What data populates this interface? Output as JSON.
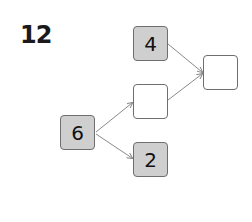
{
  "problem": {
    "number": "12"
  },
  "nodes": [
    {
      "id": "top",
      "label": "4",
      "filled": true,
      "x": 133,
      "y": 26
    },
    {
      "id": "left",
      "label": "6",
      "filled": true,
      "x": 60,
      "y": 115
    },
    {
      "id": "middle",
      "label": "",
      "filled": false,
      "x": 133,
      "y": 84
    },
    {
      "id": "bottom",
      "label": "2",
      "filled": true,
      "x": 133,
      "y": 142
    },
    {
      "id": "right",
      "label": "",
      "filled": false,
      "x": 203,
      "y": 55
    }
  ],
  "edges": [
    {
      "from": "left",
      "to": "middle"
    },
    {
      "from": "left",
      "to": "bottom"
    },
    {
      "from": "top",
      "to": "right"
    },
    {
      "from": "middle",
      "to": "right"
    }
  ],
  "colors": {
    "filled_box": "#cfcfcf",
    "border": "#6e6e6e",
    "arrow": "#8a8a8a"
  }
}
